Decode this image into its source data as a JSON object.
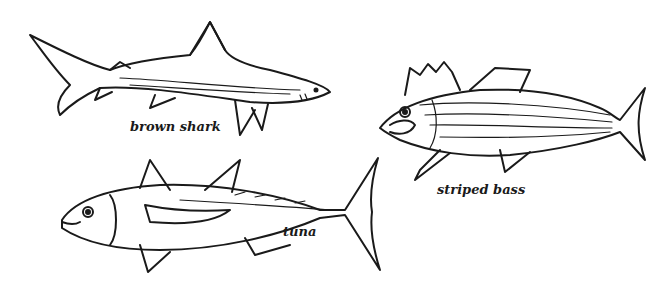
{
  "illustration": {
    "title": "Fish illustrations",
    "style": "black line drawing on white",
    "fish": [
      {
        "id": "brown-shark",
        "label": "brown shark"
      },
      {
        "id": "striped-bass",
        "label": "striped bass"
      },
      {
        "id": "tuna",
        "label": "tuna"
      }
    ]
  },
  "colors": {
    "background": "#ffffff",
    "ink": "#1a1a1a"
  }
}
